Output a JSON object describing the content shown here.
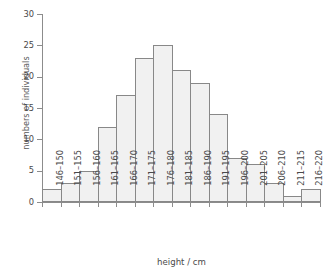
{
  "chart_data": {
    "type": "bar",
    "title": "",
    "xlabel": "height / cm",
    "ylabel": "numbers of individuals",
    "categories": [
      "146–150",
      "151–155",
      "156–160",
      "161–165",
      "166–170",
      "171–175",
      "176–180",
      "181–185",
      "186–190",
      "191–195",
      "196–200",
      "201–205",
      "206–210",
      "211–215",
      "216–220"
    ],
    "values": [
      2,
      3,
      5,
      12,
      17,
      23,
      25,
      21,
      19,
      14,
      7,
      6,
      3,
      1,
      2
    ],
    "ylim": [
      0,
      30
    ],
    "yticks": [
      0,
      5,
      10,
      15,
      20,
      25,
      30
    ],
    "ytick_labels": [
      "0",
      "5",
      "10",
      "15",
      "20",
      "25",
      "30"
    ],
    "grid": false,
    "legend": null,
    "bar_fill_color": "#f1f1f1",
    "bar_border_color": "#888888",
    "axis_color": "#8c8c8c",
    "text_color": "#4a4a4a",
    "background_color": "#ffffff"
  }
}
